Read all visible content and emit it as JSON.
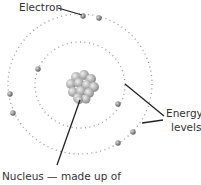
{
  "labels": {
    "electron": "Electron",
    "energy_levels_line1": "Energy",
    "energy_levels_line2": "levels",
    "nucleus": "Nucleus — made up of"
  },
  "colors": {
    "electron": "#6e6e6e",
    "orbit": "#9a9a9a",
    "leader": "#222222",
    "text": "#333333"
  }
}
